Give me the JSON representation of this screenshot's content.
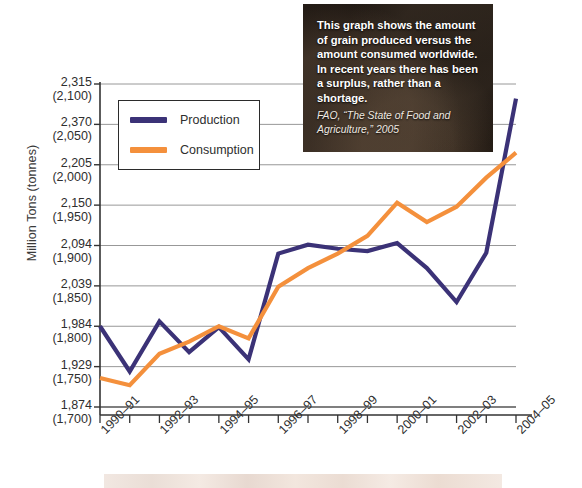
{
  "chart_data": {
    "type": "line",
    "title": "",
    "xlabel": "",
    "ylabel": "Million Tons (tonnes)",
    "grid": true,
    "legend_position": "upper-left",
    "x": [
      "1990–91",
      "1991–92",
      "1992–93",
      "1993–94",
      "1994–95",
      "1995–96",
      "1996–97",
      "1997–98",
      "1998–99",
      "1999–2000",
      "2000–01",
      "2001–02",
      "2002–03",
      "2003–04",
      "2004–05"
    ],
    "xtick_labels_shown": [
      "1990–91",
      "1992–93",
      "1994–95",
      "1996–97",
      "1998–99",
      "2000–01",
      "2002–03",
      "2004–05"
    ],
    "ylim_tonnes": [
      1700,
      2100
    ],
    "ytick_labels": [
      {
        "tons": "2,315",
        "tonnes": "(2,100)",
        "value": 2100
      },
      {
        "tons": "2,370",
        "tonnes": "(2,050)",
        "value": 2050
      },
      {
        "tons": "2,205",
        "tonnes": "(2,000)",
        "value": 2000
      },
      {
        "tons": "2,150",
        "tonnes": "(1,950)",
        "value": 1950
      },
      {
        "tons": "2,094",
        "tonnes": "(1,900)",
        "value": 1900
      },
      {
        "tons": "2,039",
        "tonnes": "(1,850)",
        "value": 1850
      },
      {
        "tons": "1,984",
        "tonnes": "(1,800)",
        "value": 1800
      },
      {
        "tons": "1,929",
        "tonnes": "(1,750)",
        "value": 1750
      },
      {
        "tons": "1,874",
        "tonnes": "(1,700)",
        "value": 1700
      }
    ],
    "series": [
      {
        "name": "Production",
        "color": "#3b3277",
        "values": [
          1800,
          1744,
          1806,
          1768,
          1799,
          1759,
          1890,
          1901,
          1896,
          1893,
          1903,
          1872,
          1830,
          1891,
          2082
        ]
      },
      {
        "name": "Consumption",
        "color": "#f4903c",
        "values": [
          1736,
          1727,
          1766,
          1781,
          1800,
          1785,
          1849,
          1872,
          1890,
          1912,
          1953,
          1929,
          1948,
          1984,
          2015
        ]
      }
    ]
  },
  "legend": {
    "items": [
      {
        "label": "Production",
        "color": "#3b3277"
      },
      {
        "label": "Consumption",
        "color": "#f4903c"
      }
    ]
  },
  "caption": {
    "body": "This graph shows the amount of grain produced versus the amount consumed worldwide. In recent years there has been a surplus, rather than a shortage.",
    "source": "FAO, “The State of Food and Agriculture,” 2005"
  }
}
